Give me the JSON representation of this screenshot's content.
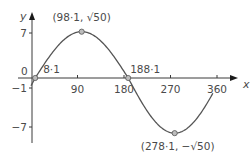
{
  "chart_data": {
    "type": "line",
    "title": "",
    "xlabel": "x",
    "ylabel": "y",
    "function": "y = 7 sin x - cos x = √50 sin(x - 8.1)",
    "xlim": [
      0,
      360
    ],
    "ylim": [
      -7.07,
      7.07
    ],
    "x_ticks": [
      90,
      180,
      270,
      360
    ],
    "x_tick_labels": [
      "90",
      "180",
      "270",
      "360"
    ],
    "y_ticks": [
      7,
      -1,
      -7
    ],
    "y_tick_labels": [
      "7",
      "−1",
      "−7"
    ],
    "origin_label": "0",
    "grid": false,
    "legend": null,
    "series": [
      {
        "name": "curve",
        "x": [
          0,
          8.1,
          45,
          98.1,
          135,
          188.1,
          225,
          278.1,
          315,
          360
        ],
        "y": [
          -1,
          0,
          4.24,
          7.07,
          4.24,
          0,
          -4.24,
          -7.07,
          -4.24,
          -1
        ]
      }
    ],
    "annotations": [
      {
        "x": 8.1,
        "y": 0,
        "text": "8·1",
        "marker": true
      },
      {
        "x": 98.1,
        "y": 7.07,
        "text": "(98·1, √50)",
        "marker": true
      },
      {
        "x": 188.1,
        "y": 0,
        "text": "188·1",
        "marker": true
      },
      {
        "x": 278.1,
        "y": -7.07,
        "text": "(278·1, −√50)",
        "marker": true
      }
    ],
    "colors": {
      "axis": "#3a3a3a",
      "curve": "#555555",
      "marker_fill": "#bdbdbd",
      "text": "#4a4a4a"
    }
  }
}
